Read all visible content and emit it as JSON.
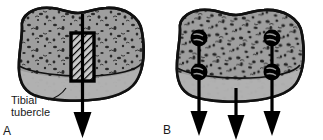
{
  "figure": {
    "type": "medical-illustration",
    "background_color": "#ffffff",
    "outline_color": "#1a1a1a",
    "bone_fill_color": "#9e9e9e",
    "cortical_band_color": "#b5b5b5",
    "trabecular_speckle_color": "#2b2b2b",
    "hardware_color": "#000000"
  },
  "panels": [
    {
      "id": "A",
      "letter": "A",
      "caption_label": "Tibial tubercle",
      "caption_lines": [
        "Tibial",
        "tubercle"
      ],
      "arrow_count": 1,
      "graft_shape": "hatched-rectangle",
      "screw_count": 0,
      "description": "Single central hatched bone block with one downward arrow"
    },
    {
      "id": "B",
      "letter": "B",
      "caption_label": "",
      "caption_lines": [],
      "arrow_count": 3,
      "graft_shape": "none",
      "screw_count": 4,
      "description": "Two lateral arrows each with two round screws, plus one central arrow"
    }
  ],
  "labels": {
    "tibial_tubercle_line1": "Tibial",
    "tibial_tubercle_line2": "tubercle",
    "panel_a": "A",
    "panel_b": "B"
  }
}
